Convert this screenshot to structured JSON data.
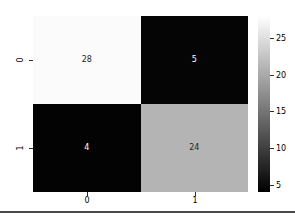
{
  "chart_data": {
    "type": "heatmap",
    "title": "",
    "xlabel": "",
    "ylabel": "",
    "categories_x": [
      "0",
      "1"
    ],
    "categories_y": [
      "0",
      "1"
    ],
    "matrix": [
      [
        28,
        5
      ],
      [
        4,
        24
      ]
    ],
    "cells": [
      {
        "row": "0",
        "col": "0",
        "value": "28",
        "fill": "#fbfbfb",
        "text_color": "#262626"
      },
      {
        "row": "0",
        "col": "1",
        "value": "5",
        "fill": "#050505",
        "text_color": "#ffffff"
      },
      {
        "row": "1",
        "col": "0",
        "value": "4",
        "fill": "#030303",
        "text_color": "#ffffff"
      },
      {
        "row": "1",
        "col": "1",
        "value": "24",
        "fill": "#b4b4b4",
        "text_color": "#262626"
      }
    ],
    "colormap": "gray",
    "colorbar": {
      "ticks": [
        "25",
        "20",
        "15",
        "10",
        "5"
      ],
      "tick_values": [
        25,
        20,
        15,
        10,
        5
      ],
      "vmin": 4,
      "vmax": 28,
      "low_color": "#000000",
      "high_color": "#ffffff",
      "orientation": "vertical"
    },
    "grid": false,
    "legend": "none"
  },
  "axes": {
    "y_ticks": [
      {
        "label": "0"
      },
      {
        "label": "1"
      }
    ],
    "x_ticks": [
      {
        "label": "0"
      },
      {
        "label": "1"
      }
    ]
  }
}
